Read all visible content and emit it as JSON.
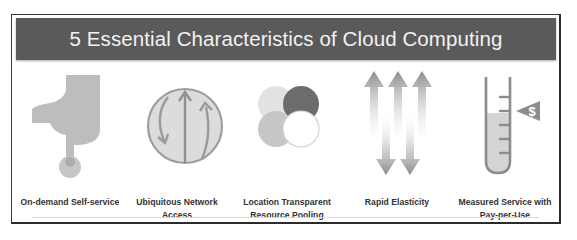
{
  "title": "5 Essential Characteristics of Cloud Computing",
  "colors": {
    "banner_bg": "#5a5a5a",
    "banner_text": "#f2f2f2",
    "icon_gray": "#b3b3b3",
    "icon_light": "#d9d9d9",
    "icon_dark": "#6e6e6e"
  },
  "characteristics": [
    {
      "label_line1": "On-demand Self-service",
      "label_line2": "",
      "icon": "hand-pointer-icon"
    },
    {
      "label_line1": "Ubiquitous Network",
      "label_line2": "Access",
      "icon": "globe-arrows-icon"
    },
    {
      "label_line1": "Location Transparent",
      "label_line2": "Resource Pooling",
      "icon": "overlapping-circles-icon"
    },
    {
      "label_line1": "Rapid Elasticity",
      "label_line2": "",
      "icon": "up-down-arrows-icon"
    },
    {
      "label_line1": "Measured Service with",
      "label_line2": "Pay-per-Use",
      "icon": "test-tube-dollar-icon"
    }
  ],
  "measure_badge": "$"
}
